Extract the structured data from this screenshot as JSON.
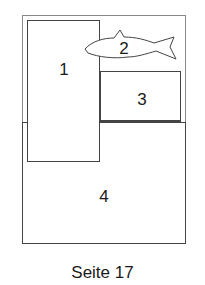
{
  "diagram": {
    "regions": [
      {
        "id": "1",
        "label": "1"
      },
      {
        "id": "2",
        "label": "2",
        "shape": "fish"
      },
      {
        "id": "3",
        "label": "3"
      },
      {
        "id": "4",
        "label": "4"
      }
    ],
    "caption": "Seite 17",
    "line_color": "#444444"
  }
}
